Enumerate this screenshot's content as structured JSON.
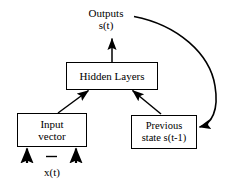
{
  "diagram": {
    "type": "block-flow-diagram",
    "background_color": "#ffffff",
    "stroke_color": "#000000",
    "nodes": [
      {
        "id": "outputs",
        "name": "outputs-label",
        "kind": "label",
        "lines": [
          "Outputs",
          "s(t)"
        ]
      },
      {
        "id": "hidden",
        "name": "hidden-layers-box",
        "kind": "box",
        "lines": [
          "Hidden Layers"
        ]
      },
      {
        "id": "input",
        "name": "input-vector-box",
        "kind": "box",
        "lines": [
          "Input",
          "vector"
        ]
      },
      {
        "id": "previous",
        "name": "previous-state-box",
        "kind": "box",
        "lines": [
          "Previous",
          "state s(t-1)"
        ]
      },
      {
        "id": "xt",
        "name": "input-signal-label",
        "kind": "label",
        "lines": [
          "x(t)"
        ]
      }
    ],
    "edges": [
      {
        "id": "hidden-to-outputs",
        "name": "arrow-hidden-to-outputs",
        "from": "hidden",
        "to": "outputs",
        "style": "straight",
        "direction": "up"
      },
      {
        "id": "input-to-hidden",
        "name": "arrow-input-to-hidden",
        "from": "input",
        "to": "hidden",
        "style": "straight",
        "direction": "up-right"
      },
      {
        "id": "previous-to-hidden",
        "name": "arrow-previous-to-hidden",
        "from": "previous",
        "to": "hidden",
        "style": "straight",
        "direction": "up-left"
      },
      {
        "id": "outputs-to-previous",
        "name": "arrow-feedback-outputs-to-previous",
        "from": "outputs",
        "to": "previous",
        "style": "curved",
        "direction": "right-then-down-then-left"
      },
      {
        "id": "xt-to-input-left",
        "name": "arrow-input-signal-left",
        "from": "xt",
        "to": "input",
        "style": "straight",
        "direction": "up"
      },
      {
        "id": "xt-to-input-right",
        "name": "arrow-input-signal-right",
        "from": "xt",
        "to": "input",
        "style": "straight",
        "direction": "up"
      }
    ],
    "decorations": [
      {
        "id": "ellipsis-dash",
        "name": "input-ellipsis-dash",
        "description": "short horizontal dash indicating omitted inputs"
      }
    ]
  }
}
